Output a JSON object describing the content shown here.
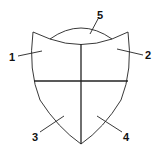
{
  "diagram": {
    "type": "shield",
    "colors": {
      "stroke": "#222222",
      "background": "#ffffff",
      "text": "#111111"
    },
    "labels": [
      {
        "id": "1",
        "text": "1",
        "region": "upper-left"
      },
      {
        "id": "2",
        "text": "2",
        "region": "upper-right"
      },
      {
        "id": "3",
        "text": "3",
        "region": "lower-left"
      },
      {
        "id": "4",
        "text": "4",
        "region": "lower-right"
      },
      {
        "id": "5",
        "text": "5",
        "region": "top-lens"
      }
    ]
  }
}
